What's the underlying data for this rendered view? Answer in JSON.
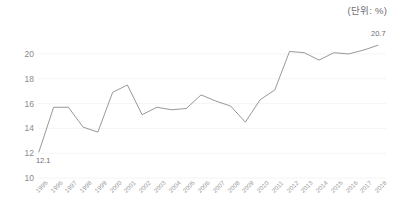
{
  "unit_note": "(단위: %)",
  "chart_data": {
    "type": "line",
    "title": "",
    "subtitle": "",
    "xlabel": "",
    "ylabel": "",
    "unit_label": "(단위: %)",
    "grid": true,
    "grid_axis": "y",
    "legend": false,
    "legend_position": "none",
    "line_color": "#8c8c8c",
    "background_color": "#ffffff",
    "axis_label_color": "#8a8a8a",
    "ylim": [
      10,
      20.8
    ],
    "yticks": [
      10,
      12,
      14,
      16,
      18,
      20
    ],
    "ytick_labels": [
      "10",
      "12",
      "14",
      "16",
      "18",
      "20"
    ],
    "categories": [
      "1995",
      "1996",
      "1997",
      "1998",
      "1999",
      "2000",
      "2001",
      "2002",
      "2003",
      "2004",
      "2005",
      "2006",
      "2007",
      "2008",
      "2009",
      "2010",
      "2011",
      "2012",
      "2013",
      "2014",
      "2015",
      "2016",
      "2017",
      "2018"
    ],
    "values": [
      12.1,
      15.7,
      15.7,
      14.1,
      13.7,
      16.9,
      17.5,
      15.1,
      15.7,
      15.5,
      15.6,
      16.7,
      16.2,
      15.8,
      14.5,
      16.3,
      17.1,
      20.2,
      20.1,
      19.5,
      20.1,
      20.0,
      20.3,
      20.7
    ],
    "annotations": [
      {
        "category": "1995",
        "value": 12.1,
        "text": "12.1",
        "position": "below-right"
      },
      {
        "category": "2018",
        "value": 20.7,
        "text": "20.7",
        "position": "above"
      }
    ]
  }
}
